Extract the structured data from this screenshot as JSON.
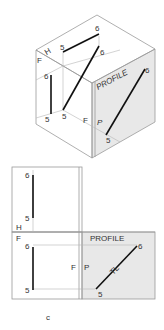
{
  "figure": {
    "caption": "c",
    "colors": {
      "profile_fill": "#e8e8e8",
      "edge": "#9a9a9a",
      "line": "#111111"
    }
  },
  "isometric": {
    "plane_labels": {
      "horizontal": "H",
      "frontal_top": "F",
      "frontal_bottom": "F",
      "profile": "P",
      "profile_title": "PROFILE"
    },
    "points": {
      "top_6": "6",
      "top_5": "5",
      "front_6": "6",
      "front_5": "5",
      "back_6": "6",
      "back_5": "5",
      "profile_6": "6",
      "profile_5": "5"
    }
  },
  "orthographic": {
    "plane_labels": {
      "horizontal": "H",
      "frontal": "F",
      "frontal_fold": "F",
      "profile_fold": "P",
      "profile_title": "PROFILE",
      "true_length": "TL"
    },
    "points": {
      "top_6": "6",
      "top_5": "5",
      "front_6": "6",
      "front_5": "5",
      "profile_6": "6",
      "profile_5": "5"
    }
  }
}
